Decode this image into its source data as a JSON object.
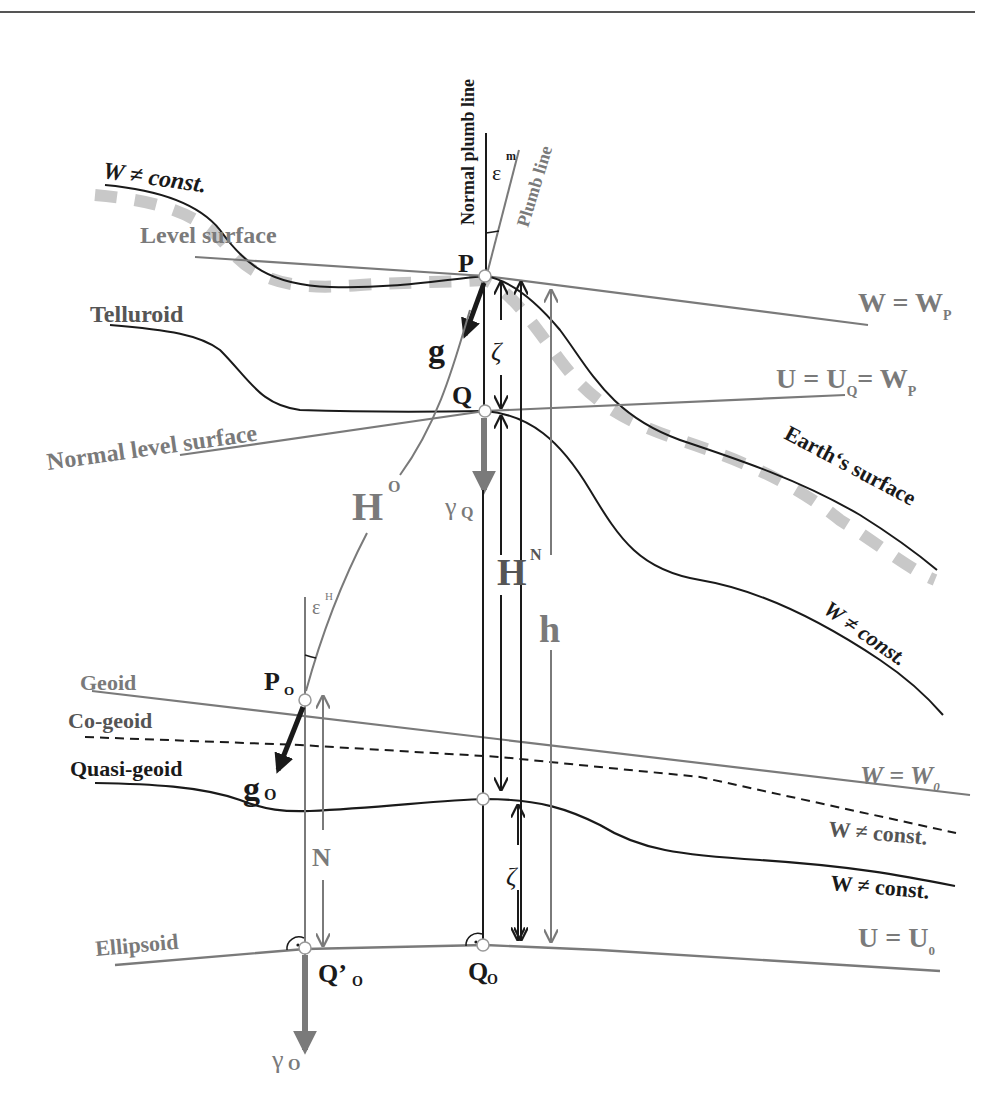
{
  "figure": {
    "colors": {
      "black_line": "#1a1a1a",
      "gray_line": "#7a7a7a",
      "dashed_surface": "#c8c8c8",
      "background": "#ffffff",
      "header_rule": "#555555"
    },
    "surfaces": {
      "w_not_const_top": "W ≠ const.",
      "level_surface": "Level surface",
      "telluroid": "Telluroid",
      "normal_level_surface": "Normal level surface",
      "earths_surface": "Earth‘s surface",
      "w_not_const_right": "W ≠ const.",
      "geoid": "Geoid",
      "co_geoid": "Co-geoid",
      "quasi_geoid": "Quasi-geoid",
      "ellipsoid": "Ellipsoid"
    },
    "equations": {
      "w_eq_wp": {
        "base": "W = W",
        "sub": "P"
      },
      "u_eq_uq_eq_wp": {
        "base1": "U = U",
        "sub1": "Q",
        "mid": "= W",
        "sub2": "P"
      },
      "w_eq_w0": {
        "base": "W = W",
        "sub": "0"
      },
      "w_not_const_cogeoid": "W ≠ const.",
      "w_not_const_quasigeoid": "W ≠ const.",
      "u_eq_u0": {
        "base": "U = U",
        "sub": "0"
      }
    },
    "lines": {
      "normal_plumb_line": "Normal plumb line",
      "plumb_line": "Plumb line"
    },
    "points": {
      "P": "P",
      "Q": "Q",
      "Po": {
        "base": "P",
        "sub": "O"
      },
      "Q_prime_o": {
        "base": "Q’",
        "sub": "O"
      },
      "Qo": {
        "base": "Q",
        "sub": "O"
      }
    },
    "quantities": {
      "epsilon_m": {
        "base": "ε",
        "sup": "m"
      },
      "epsilon_h": {
        "base": "ε",
        "sup": "H"
      },
      "g": "g",
      "g_o": {
        "base": "g",
        "sub": "O"
      },
      "gamma_q": {
        "base": "γ",
        "sub": "Q"
      },
      "gamma_o": {
        "base": "γ",
        "sub": "O"
      },
      "zeta_top": "ζ",
      "zeta_bottom": "ζ",
      "H_O": {
        "base": "H",
        "sup": "O"
      },
      "H_N": {
        "base": "H",
        "sup": "N"
      },
      "h": "h",
      "N": "N"
    }
  }
}
